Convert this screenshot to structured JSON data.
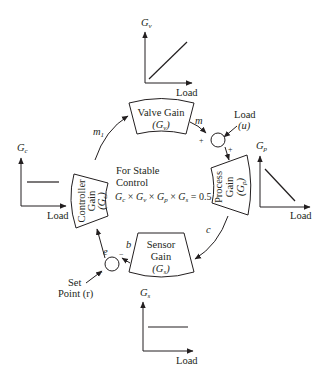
{
  "blocks": {
    "valve": {
      "line1": "Valve Gain",
      "symbol": "G",
      "sub": "v"
    },
    "process": {
      "line1": "Process",
      "line2": "Gain",
      "symbol": "G",
      "sub": "p"
    },
    "sensor": {
      "line1": "Sensor",
      "line2": "Gain",
      "symbol": "G",
      "sub": "s"
    },
    "controller": {
      "line1": "Controller",
      "line2": "Gain",
      "symbol": "G",
      "sub": "c"
    }
  },
  "signals": {
    "m1": "m",
    "m1_sub": "1",
    "m": "m",
    "c": "c",
    "b": "b",
    "e": "e"
  },
  "inputs": {
    "load": {
      "line1": "Load",
      "line2": "(u)"
    },
    "setpoint": {
      "line1": "Set",
      "line2": "Point (r)"
    }
  },
  "signs": {
    "plus": "+",
    "minus": "−"
  },
  "center": {
    "line1": "For Stable",
    "line2": "Control",
    "equation": "Gc × Gv × Gp × Gs = 0.5"
  },
  "graphs": {
    "valve": {
      "ylabel": "G",
      "ysub": "v",
      "xlabel": "Load",
      "shape": "increasing"
    },
    "process": {
      "ylabel": "G",
      "ysub": "p",
      "xlabel": "Load",
      "shape": "decreasing"
    },
    "controller": {
      "ylabel": "G",
      "ysub": "c",
      "xlabel": "Load",
      "shape": "constant"
    },
    "sensor": {
      "ylabel": "G",
      "ysub": "s",
      "xlabel": "Load",
      "shape": "constant"
    }
  }
}
